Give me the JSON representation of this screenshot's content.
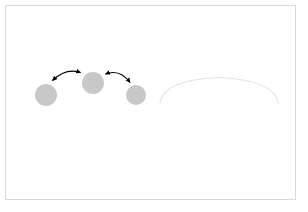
{
  "canvas": {
    "width": 308,
    "height": 212,
    "background_color": "#ffffff",
    "border_color": "#d9d9d9"
  },
  "figure": {
    "title": "",
    "caption": ""
  },
  "nodes": [
    {
      "id": "node-left",
      "label": "",
      "cx": 46,
      "cy": 95,
      "r": 11,
      "fill": "#c8c8c8"
    },
    {
      "id": "node-middle",
      "label": "",
      "cx": 93,
      "cy": 83,
      "r": 11,
      "fill": "#c8c8c8"
    },
    {
      "id": "node-right",
      "label": "",
      "cx": 136,
      "cy": 95,
      "r": 10,
      "fill": "#c8c8c8"
    }
  ],
  "connectors": [
    {
      "id": "connector-left-middle",
      "label": "",
      "from": "node-left",
      "to": "node-middle",
      "arrowheads": "both",
      "color": "#000000",
      "stroke_width": 1.1,
      "path": "M 52.5 80.5 Q 66 67.5 80.5 72.5"
    },
    {
      "id": "connector-middle-right",
      "label": "",
      "from": "node-right",
      "to": "node-middle",
      "arrowheads": "both",
      "color": "#000000",
      "stroke_width": 1.1,
      "path": "M 105.5 74 Q 120 68.5 130 82.5"
    }
  ],
  "faint_arc": {
    "id": "faint-arc",
    "label": "",
    "color": "#e4e4e4",
    "stroke_width": 1.1,
    "path": "M 160 103 Q 163 80 219 77.5 Q 274 80 278.5 103"
  },
  "colors": {
    "node_fill": "#c8c8c8",
    "arrow_stroke": "#000000",
    "faint_arc_stroke": "#e4e4e4",
    "frame_border": "#d9d9d9",
    "background": "#ffffff"
  }
}
